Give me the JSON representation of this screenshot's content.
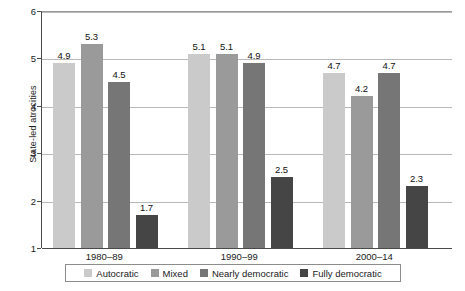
{
  "chart_data": {
    "type": "bar",
    "title": "",
    "xlabel": "",
    "ylabel": "State-led atrocities",
    "ylim": [
      1,
      6
    ],
    "yticks": [
      "1",
      "2",
      "3",
      "4",
      "5",
      "6"
    ],
    "grid": true,
    "legend_position": "bottom",
    "categories": [
      "1980–89",
      "1990–99",
      "2000–14"
    ],
    "series": [
      {
        "name": "Autocratic",
        "color": "#cacaca",
        "values": [
          4.9,
          5.1,
          4.7
        ]
      },
      {
        "name": "Mixed",
        "color": "#9a9a9a",
        "values": [
          5.3,
          5.1,
          4.2
        ]
      },
      {
        "name": "Nearly democratic",
        "color": "#767676",
        "values": [
          4.5,
          4.9,
          4.7
        ]
      },
      {
        "name": "Fully democratic",
        "color": "#454545",
        "values": [
          1.7,
          2.5,
          2.3
        ]
      }
    ],
    "value_labels": [
      [
        "4.9",
        "5.3",
        "4.5",
        "1.7"
      ],
      [
        "5.1",
        "5.1",
        "4.9",
        "2.5"
      ],
      [
        "4.7",
        "4.2",
        "4.7",
        "2.3"
      ]
    ]
  }
}
